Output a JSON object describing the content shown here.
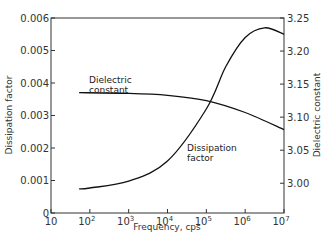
{
  "chart_data": {
    "type": "line",
    "title": "",
    "xlabel": "Frequency, cps",
    "ylabel": "Dissipation factor",
    "y2label": "Dielectric constant",
    "xscale": "log",
    "xlim": [
      10,
      10000000
    ],
    "ylim": [
      0,
      0.006
    ],
    "y2lim": [
      2.955,
      3.25
    ],
    "grid": false,
    "x_ticks": [
      {
        "base": "10",
        "exp": ""
      },
      {
        "base": "10",
        "exp": "2"
      },
      {
        "base": "10",
        "exp": "3"
      },
      {
        "base": "10",
        "exp": "4"
      },
      {
        "base": "10",
        "exp": "5"
      },
      {
        "base": "10",
        "exp": "6"
      },
      {
        "base": "10",
        "exp": "7"
      }
    ],
    "y_ticks": [
      "0",
      "0.001",
      "0.002",
      "0.003",
      "0.004",
      "0.005",
      "0.006"
    ],
    "y2_ticks": [
      "3.00",
      "3.05",
      "3.10",
      "3.15",
      "3.20",
      "3.25"
    ],
    "series": [
      {
        "name": "Dissipation factor",
        "axis": "left",
        "x": [
          53,
          100,
          1000,
          10000,
          100000,
          316000,
          1000000,
          3160000,
          10000000
        ],
        "values": [
          0.00074,
          0.00077,
          0.00098,
          0.0016,
          0.0032,
          0.0045,
          0.0054,
          0.0057,
          0.0055
        ]
      },
      {
        "name": "Dielectric constant",
        "axis": "right",
        "x": [
          53,
          1000,
          10000,
          100000,
          1000000,
          10000000
        ],
        "values": [
          3.137,
          3.136,
          3.133,
          3.125,
          3.107,
          3.081
        ]
      }
    ],
    "annotations": [
      {
        "text_line1": "Dielectric",
        "text_line2": "constant"
      },
      {
        "text_line1": "Dissipation",
        "text_line2": "factor"
      }
    ],
    "legend": "none (inline annotations)"
  }
}
